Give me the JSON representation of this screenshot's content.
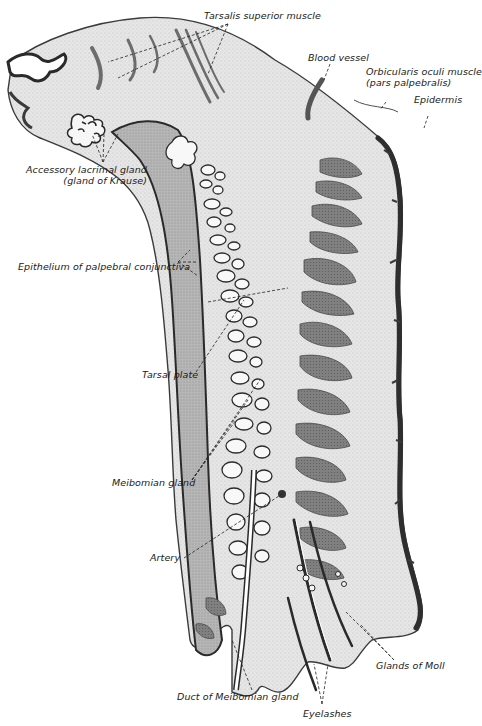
{
  "figure": {
    "colors": {
      "background": "#ffffff",
      "connective_tissue": "#e4e4e4",
      "conjunctiva": "#b4b4b4",
      "muscle": "#7a7a7a",
      "epidermis": "#3a3a3a",
      "gland_fill": "#f4f4f4",
      "outline": "#2a2a2a"
    }
  },
  "labels": {
    "tarsalis_superior": "Tarsalis superior muscle",
    "blood_vessel": "Blood vessel",
    "orbicularis_line1": "Orbicularis oculi muscle",
    "orbicularis_line2": "(pars palpebralis)",
    "epidermis": "Epidermis",
    "accessory_line1": "Accessory lacrimal gland",
    "accessory_line2": "(gland of Krause)",
    "epithelium": "Epithelium of palpebral conjunctiva",
    "tarsal_plate": "Tarsal plate",
    "meibomian_gland": "Meibomian gland",
    "artery": "Artery",
    "glands_of_moll": "Glands of Moll",
    "duct_meibomian": "Duct of Meibomian gland",
    "eyelashes": "Eyelashes"
  }
}
